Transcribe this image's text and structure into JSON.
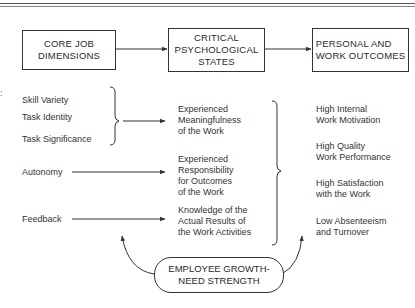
{
  "diagram": {
    "headers": [
      {
        "label": "CORE JOB\nDIMENSIONS"
      },
      {
        "label": "CRITICAL\nPSYCHOLOGICAL\nSTATES"
      },
      {
        "label": "PERSONAL AND\nWORK OUTCOMES"
      }
    ],
    "core_dimensions": [
      {
        "label": "Skill Variety"
      },
      {
        "label": "Task Identity"
      },
      {
        "label": "Task Significance"
      },
      {
        "label": "Autonomy"
      },
      {
        "label": "Feedback"
      }
    ],
    "psychological_states": [
      {
        "label": "Experienced\nMeaningfulness\nof the Work"
      },
      {
        "label": "Experienced\nResponsibility\nfor Outcomes\nof the Work"
      },
      {
        "label": "Knowledge of the\nActual Results of\nthe Work Activities"
      }
    ],
    "outcomes": [
      {
        "label": "High Internal\nWork Motivation"
      },
      {
        "label": "High Quality\nWork Performance"
      },
      {
        "label": "High Satisfaction\nwith the Work"
      },
      {
        "label": "Low Absenteeism\nand Turnover"
      }
    ],
    "moderator": {
      "label": "EMPLOYEE GROWTH-\nNEED STRENGTH"
    },
    "stray_mark": ":",
    "line_color": "#333333"
  }
}
